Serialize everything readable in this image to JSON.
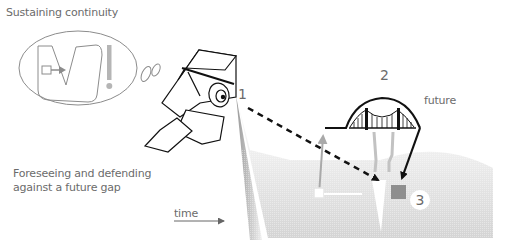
{
  "diagram": {
    "title_top": "Sustaining continuity",
    "title_bottom": "Foreseeing and defending against a future gap",
    "time_label": "time",
    "future_label": "future",
    "step_labels": [
      "1",
      "2",
      "3"
    ],
    "icons": {
      "thought_bubble": "thought-bubble-icon",
      "exclamation": "exclamation-icon",
      "person_with_binoculars": "person-binoculars-icon",
      "bridge": "suspension-bridge-icon",
      "time_arrow": "arrow-right-icon",
      "gap_marker": "gap-square-icon"
    },
    "colors": {
      "text": "#6b6b6b",
      "line": "#111111",
      "gray_arrow": "#a9a9a9",
      "gap_square": "#8a8a8a",
      "terrain": "#d9d9d9"
    }
  }
}
